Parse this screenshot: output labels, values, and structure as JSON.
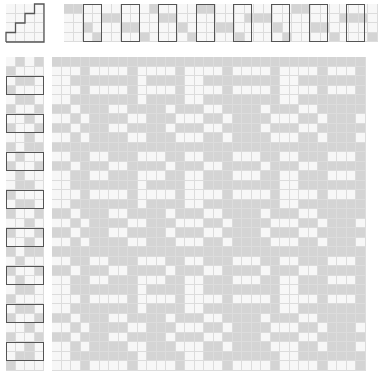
{
  "colors": {
    "filled": "#d4d4d4",
    "filled_faint": "#e6e6e6",
    "empty": "#f7f7f7",
    "grid": "#dcdcdc",
    "outline": "#555555"
  },
  "shafts": 4,
  "treadles": 4,
  "tieup": [
    [
      0,
      0,
      0,
      1
    ],
    [
      0,
      0,
      1,
      1
    ],
    [
      0,
      1,
      1,
      0
    ],
    [
      1,
      1,
      0,
      0
    ]
  ],
  "threading": [
    0,
    0,
    2,
    3,
    1,
    1,
    2,
    2,
    3,
    0,
    1,
    1,
    2,
    3,
    0,
    0,
    2,
    2,
    3,
    1,
    1,
    1,
    2,
    3,
    0,
    0,
    2,
    2,
    3,
    1,
    1,
    1,
    3
  ],
  "treadling": [
    [
      0,
      1,
      0,
      1
    ],
    [
      1,
      0,
      0,
      0
    ],
    [
      0,
      1,
      1,
      0
    ],
    [
      1,
      0,
      0,
      0
    ],
    [
      0,
      1,
      1,
      0
    ],
    [
      1,
      0,
      0,
      1
    ],
    [
      0,
      0,
      1,
      0
    ],
    [
      1,
      0,
      0,
      1
    ],
    [
      0,
      0,
      1,
      0
    ],
    [
      1,
      0,
      1,
      1
    ],
    [
      0,
      1,
      0,
      0
    ],
    [
      1,
      0,
      0,
      1
    ],
    [
      0,
      1,
      0,
      0
    ],
    [
      0,
      1,
      1,
      0
    ],
    [
      1,
      0,
      0,
      0
    ],
    [
      0,
      1,
      1,
      0
    ],
    [
      1,
      0,
      0,
      1
    ],
    [
      0,
      0,
      1,
      0
    ],
    [
      1,
      0,
      0,
      1
    ],
    [
      0,
      0,
      1,
      0
    ],
    [
      1,
      0,
      1,
      1
    ],
    [
      0,
      1,
      0,
      0
    ],
    [
      1,
      0,
      0,
      1
    ],
    [
      0,
      1,
      0,
      0
    ],
    [
      0,
      1,
      1,
      0
    ],
    [
      1,
      0,
      0,
      0
    ],
    [
      0,
      1,
      1,
      0
    ],
    [
      1,
      0,
      0,
      1
    ],
    [
      0,
      0,
      1,
      0
    ],
    [
      1,
      0,
      0,
      1
    ],
    [
      0,
      0,
      1,
      0
    ],
    [
      0,
      1,
      1,
      0
    ],
    [
      1,
      0,
      0,
      0
    ]
  ]
}
